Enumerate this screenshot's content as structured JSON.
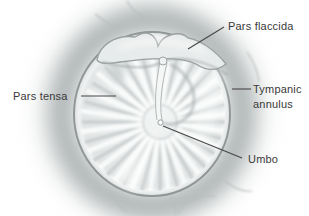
{
  "diagram": {
    "labels": {
      "pars_flaccida": "Pars flaccida",
      "pars_tensa": "Pars tensa",
      "tympanic_annulus": "Tympanic annulus",
      "umbo": "Umbo"
    },
    "colors": {
      "background": "#ffffff",
      "label_text": "#3a3a3a",
      "leader_line": "#474747",
      "membrane_highlight": "#f4f6f6",
      "membrane_base": "#e3e6e6",
      "membrane_rim": "#8f9595",
      "annulus_band": "#f1f3f3",
      "canal_shadow": "#a5abab",
      "striation_gray": "#c5caca",
      "striation_white": "#fbfcfc"
    }
  }
}
